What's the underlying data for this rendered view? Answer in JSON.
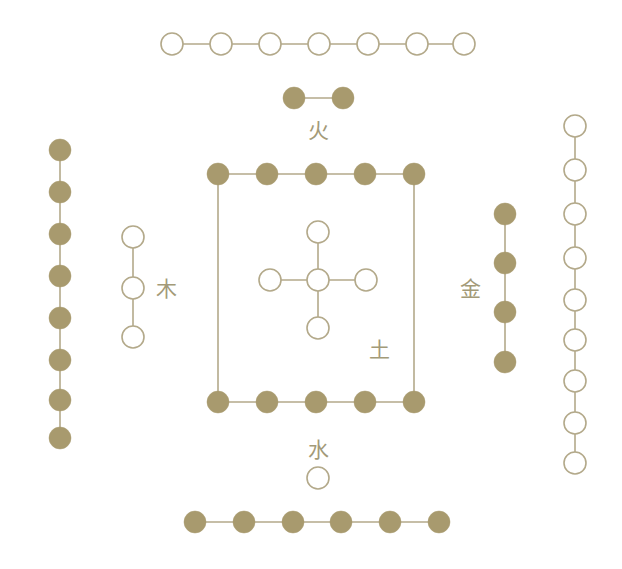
{
  "diagram": {
    "background_color": "#ffffff",
    "filled_dot_color": "#a89a6e",
    "hollow_dot_fill": "#ffffff",
    "stroke_color": "#b3a98a",
    "label_color": "#a39a78",
    "dot_radius": 11,
    "stroke_width": 1.6
  },
  "labels": [
    {
      "id": "fire",
      "text": "火",
      "x": 318,
      "y": 131
    },
    {
      "id": "wood",
      "text": "木",
      "x": 166,
      "y": 289
    },
    {
      "id": "earth",
      "text": "土",
      "x": 379,
      "y": 350
    },
    {
      "id": "metal",
      "text": "金",
      "x": 470,
      "y": 289
    },
    {
      "id": "water",
      "text": "水",
      "x": 318,
      "y": 450
    }
  ],
  "groups": [
    {
      "id": "top-row-seven",
      "name": "top-row-seven-hollow",
      "orientation": "horizontal",
      "count": 7,
      "style": "hollow",
      "dots": [
        {
          "x": 172,
          "y": 44
        },
        {
          "x": 221,
          "y": 44
        },
        {
          "x": 270,
          "y": 44
        },
        {
          "x": 319,
          "y": 44
        },
        {
          "x": 368,
          "y": 44
        },
        {
          "x": 417,
          "y": 44
        },
        {
          "x": 464,
          "y": 44
        }
      ],
      "links": [
        [
          0,
          1
        ],
        [
          1,
          2
        ],
        [
          2,
          3
        ],
        [
          3,
          4
        ],
        [
          4,
          5
        ],
        [
          5,
          6
        ]
      ]
    },
    {
      "id": "fire-pair",
      "name": "fire-two-filled",
      "orientation": "horizontal",
      "count": 2,
      "style": "filled",
      "dots": [
        {
          "x": 294,
          "y": 98
        },
        {
          "x": 343,
          "y": 98
        }
      ],
      "links": [
        [
          0,
          1
        ]
      ]
    },
    {
      "id": "left-column-eight",
      "name": "left-column-eight-filled",
      "orientation": "vertical",
      "count": 8,
      "style": "filled",
      "dots": [
        {
          "x": 60,
          "y": 150
        },
        {
          "x": 60,
          "y": 192
        },
        {
          "x": 60,
          "y": 234
        },
        {
          "x": 60,
          "y": 276
        },
        {
          "x": 60,
          "y": 318
        },
        {
          "x": 60,
          "y": 360
        },
        {
          "x": 60,
          "y": 400
        },
        {
          "x": 60,
          "y": 438
        }
      ],
      "links": [
        [
          0,
          1
        ],
        [
          1,
          2
        ],
        [
          2,
          3
        ],
        [
          3,
          4
        ],
        [
          4,
          5
        ],
        [
          5,
          6
        ],
        [
          6,
          7
        ]
      ]
    },
    {
      "id": "right-column-nine",
      "name": "right-column-nine-hollow",
      "orientation": "vertical",
      "count": 9,
      "style": "hollow",
      "dots": [
        {
          "x": 575,
          "y": 126
        },
        {
          "x": 575,
          "y": 170
        },
        {
          "x": 575,
          "y": 214
        },
        {
          "x": 575,
          "y": 258
        },
        {
          "x": 575,
          "y": 300
        },
        {
          "x": 575,
          "y": 340
        },
        {
          "x": 575,
          "y": 381
        },
        {
          "x": 575,
          "y": 423
        },
        {
          "x": 575,
          "y": 463
        }
      ],
      "links": [
        [
          0,
          1
        ],
        [
          1,
          2
        ],
        [
          2,
          3
        ],
        [
          3,
          4
        ],
        [
          4,
          5
        ],
        [
          5,
          6
        ],
        [
          6,
          7
        ],
        [
          7,
          8
        ]
      ]
    },
    {
      "id": "wood-three",
      "name": "wood-three-hollow",
      "orientation": "vertical",
      "count": 3,
      "style": "hollow",
      "dots": [
        {
          "x": 133,
          "y": 237
        },
        {
          "x": 133,
          "y": 288
        },
        {
          "x": 133,
          "y": 337
        }
      ],
      "links": [
        [
          0,
          1
        ],
        [
          1,
          2
        ]
      ]
    },
    {
      "id": "metal-four",
      "name": "metal-four-filled",
      "orientation": "vertical",
      "count": 4,
      "style": "filled",
      "dots": [
        {
          "x": 505,
          "y": 214
        },
        {
          "x": 505,
          "y": 263
        },
        {
          "x": 505,
          "y": 312
        },
        {
          "x": 505,
          "y": 362
        }
      ],
      "links": [
        [
          0,
          1
        ],
        [
          1,
          2
        ],
        [
          2,
          3
        ]
      ]
    },
    {
      "id": "earth-square",
      "name": "earth-square-ten-filled",
      "orientation": "square",
      "count": 10,
      "style": "filled",
      "dots": [
        {
          "x": 218,
          "y": 174
        },
        {
          "x": 267,
          "y": 174
        },
        {
          "x": 316,
          "y": 174
        },
        {
          "x": 365,
          "y": 174
        },
        {
          "x": 414,
          "y": 174
        },
        {
          "x": 218,
          "y": 402
        },
        {
          "x": 267,
          "y": 402
        },
        {
          "x": 316,
          "y": 402
        },
        {
          "x": 365,
          "y": 402
        },
        {
          "x": 414,
          "y": 402
        }
      ],
      "links": [
        [
          0,
          1
        ],
        [
          1,
          2
        ],
        [
          2,
          3
        ],
        [
          3,
          4
        ],
        [
          5,
          6
        ],
        [
          6,
          7
        ],
        [
          7,
          8
        ],
        [
          8,
          9
        ],
        [
          0,
          5
        ],
        [
          4,
          9
        ]
      ]
    },
    {
      "id": "earth-cross",
      "name": "earth-cross-five-hollow",
      "orientation": "cross",
      "count": 5,
      "style": "hollow",
      "dots": [
        {
          "x": 318,
          "y": 280
        },
        {
          "x": 318,
          "y": 232
        },
        {
          "x": 318,
          "y": 328
        },
        {
          "x": 270,
          "y": 280
        },
        {
          "x": 366,
          "y": 280
        }
      ],
      "links": [
        [
          0,
          1
        ],
        [
          0,
          2
        ],
        [
          0,
          3
        ],
        [
          0,
          4
        ]
      ]
    },
    {
      "id": "water-one",
      "name": "water-one-hollow",
      "orientation": "single",
      "count": 1,
      "style": "hollow",
      "dots": [
        {
          "x": 318,
          "y": 478
        }
      ],
      "links": []
    },
    {
      "id": "bottom-row-six",
      "name": "bottom-row-six-filled",
      "orientation": "horizontal",
      "count": 6,
      "style": "filled",
      "dots": [
        {
          "x": 195,
          "y": 522
        },
        {
          "x": 244,
          "y": 522
        },
        {
          "x": 293,
          "y": 522
        },
        {
          "x": 341,
          "y": 522
        },
        {
          "x": 390,
          "y": 522
        },
        {
          "x": 439,
          "y": 522
        }
      ],
      "links": [
        [
          0,
          1
        ],
        [
          1,
          2
        ],
        [
          2,
          3
        ],
        [
          3,
          4
        ],
        [
          4,
          5
        ]
      ]
    }
  ]
}
